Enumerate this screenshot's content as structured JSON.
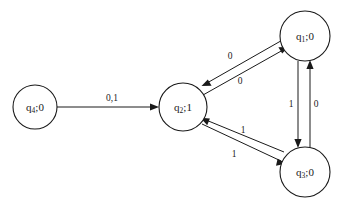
{
  "diagram": {
    "type": "finite-state-machine",
    "title": "",
    "canvas": {
      "width": 338,
      "height": 208,
      "background": "#ffffff"
    },
    "ink_color": "#1a1a1a",
    "states": [
      {
        "id": "q4",
        "label": "q",
        "subscript": "4",
        "separator": ";",
        "output": "0",
        "full_label": "q4 ; 0",
        "cx": 35,
        "cy": 107,
        "r": 22
      },
      {
        "id": "q2",
        "label": "q",
        "subscript": "2",
        "separator": ";",
        "output": "1",
        "full_label": "q2 ; 1",
        "cx": 183,
        "cy": 107,
        "r": 24
      },
      {
        "id": "q1",
        "label": "q",
        "subscript": "1",
        "separator": ";",
        "output": "0",
        "full_label": "q1 ; 0",
        "cx": 305,
        "cy": 36,
        "r": 25
      },
      {
        "id": "q3",
        "label": "q",
        "subscript": "3",
        "separator": ";",
        "output": "0",
        "full_label": "q3 ; 0",
        "cx": 305,
        "cy": 172,
        "r": 25
      }
    ],
    "transitions": [
      {
        "id": "t-q4-q2",
        "from": "q4",
        "to": "q2",
        "label": "0,1",
        "label_x": 112,
        "label_y": 99
      },
      {
        "id": "t-q2-q1",
        "from": "q2",
        "to": "q1",
        "label": "0",
        "label_x": 240,
        "label_y": 82
      },
      {
        "id": "t-q1-q2",
        "from": "q1",
        "to": "q2",
        "label": "0",
        "label_x": 230,
        "label_y": 57
      },
      {
        "id": "t-q2-q3",
        "from": "q2",
        "to": "q3",
        "label": "1",
        "label_x": 234,
        "label_y": 155
      },
      {
        "id": "t-q3-q2",
        "from": "q3",
        "to": "q2",
        "label": "1",
        "label_x": 243,
        "label_y": 131
      },
      {
        "id": "t-q1-q3",
        "from": "q1",
        "to": "q3",
        "label": "1",
        "label_x": 291,
        "label_y": 105
      },
      {
        "id": "t-q3-q1",
        "from": "q3",
        "to": "q1",
        "label": "0",
        "label_x": 316,
        "label_y": 105
      }
    ]
  }
}
